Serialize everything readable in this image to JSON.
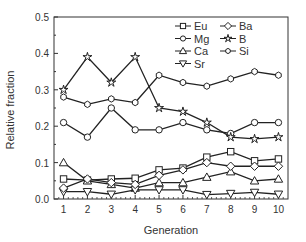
{
  "chart_data": {
    "type": "line",
    "title": "",
    "xlabel": "Generation",
    "ylabel": "Relative fraction",
    "x": [
      1,
      2,
      3,
      4,
      5,
      6,
      7,
      8,
      9,
      10
    ],
    "xlim": [
      0.6,
      10.4
    ],
    "ylim": [
      0.0,
      0.5
    ],
    "xticks": [
      "1",
      "2",
      "3",
      "4",
      "5",
      "6",
      "7",
      "8",
      "9",
      "10"
    ],
    "yticks": [
      "0.0",
      "0.1",
      "0.2",
      "0.3",
      "0.4",
      "0.5"
    ],
    "grid": false,
    "legend_position": "upper right (inside, 2 columns)",
    "series": [
      {
        "name": "Eu",
        "marker": "square",
        "values": [
          0.055,
          0.052,
          0.055,
          0.057,
          0.08,
          0.085,
          0.115,
          0.13,
          0.105,
          0.11
        ]
      },
      {
        "name": "Mg",
        "marker": "circle",
        "values": [
          0.21,
          0.17,
          0.25,
          0.19,
          0.19,
          0.21,
          0.19,
          0.18,
          0.21,
          0.21
        ]
      },
      {
        "name": "Ca",
        "marker": "triangle-up",
        "values": [
          0.1,
          0.05,
          0.04,
          0.03,
          0.045,
          0.045,
          0.06,
          0.075,
          0.05,
          0.055
        ]
      },
      {
        "name": "Sr",
        "marker": "triangle-down",
        "values": [
          0.02,
          0.02,
          0.013,
          0.025,
          0.025,
          0.025,
          0.012,
          0.015,
          0.018,
          0.013
        ]
      },
      {
        "name": "Ba",
        "marker": "diamond",
        "values": [
          0.03,
          0.055,
          0.045,
          0.04,
          0.065,
          0.08,
          0.1,
          0.09,
          0.09,
          0.09
        ]
      },
      {
        "name": "B",
        "marker": "star",
        "values": [
          0.3,
          0.39,
          0.32,
          0.39,
          0.25,
          0.24,
          0.21,
          0.17,
          0.165,
          0.17
        ]
      },
      {
        "name": "Si",
        "marker": "hexagon",
        "values": [
          0.28,
          0.26,
          0.275,
          0.265,
          0.34,
          0.32,
          0.31,
          0.33,
          0.35,
          0.34
        ]
      }
    ]
  },
  "legend": {
    "items": [
      "Eu",
      "Ba",
      "Mg",
      "B",
      "Ca",
      "Si",
      "Sr"
    ]
  }
}
